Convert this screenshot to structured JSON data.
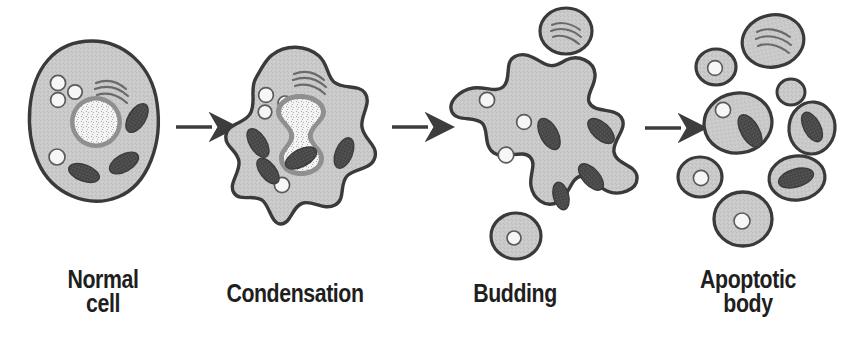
{
  "figure": {
    "background_color": "#ffffff",
    "line_color": "#333333",
    "cytoplasm_color": "#c9c9c9",
    "membrane_color": "#3a3a3a",
    "organelle_dark_color": "#4a4a4a",
    "vesicle_color": "#f5f5f5",
    "nucleus_rim_color": "#8a8a8a",
    "nucleus_fill_color": "#f2f2f2",
    "arrow_color": "#3d3d3d",
    "label_color": "#1f1f1f"
  },
  "stages": [
    {
      "id": "normal-cell",
      "label": "Normal\ncell",
      "label_lines": [
        "Normal",
        "cell"
      ],
      "order": 1,
      "description": "Intact oval cell with round nucleus, vesicles, mitochondria and Golgi apparatus",
      "organelles": {
        "nucleus": 1,
        "vesicles": 4,
        "mitochondria": 3,
        "golgi": 1
      }
    },
    {
      "id": "condensation",
      "label": "Condensation",
      "label_lines": [
        "Condensation"
      ],
      "order": 2,
      "description": "Cell shrinks with irregular lobed membrane and hourglass shaped condensed nucleus",
      "organelles": {
        "nucleus": 1,
        "vesicles": 4,
        "mitochondria": 4,
        "golgi": 1
      }
    },
    {
      "id": "budding",
      "label": "Budding",
      "label_lines": [
        "Budding"
      ],
      "order": 3,
      "description": "Star shaped cell forming membrane blebs with two detached buds",
      "organelles": {
        "nucleus": 0,
        "vesicles": 3,
        "mitochondria": 4,
        "golgi": 1,
        "detached_buds": 2
      }
    },
    {
      "id": "apoptotic-body",
      "label": "Apoptotic\nbody",
      "label_lines": [
        "Apoptotic",
        "body"
      ],
      "order": 4,
      "description": "Cell fully fragmented into eight separate membrane bound apoptotic bodies",
      "organelles": {
        "apoptotic_bodies": 8,
        "vesicles": 4,
        "mitochondria": 4,
        "golgi": 1
      }
    }
  ],
  "arrows": [
    {
      "id": "arrow-1",
      "from": "normal-cell",
      "to": "condensation"
    },
    {
      "id": "arrow-2",
      "from": "condensation",
      "to": "budding"
    },
    {
      "id": "arrow-3",
      "from": "budding",
      "to": "apoptotic-body"
    }
  ]
}
